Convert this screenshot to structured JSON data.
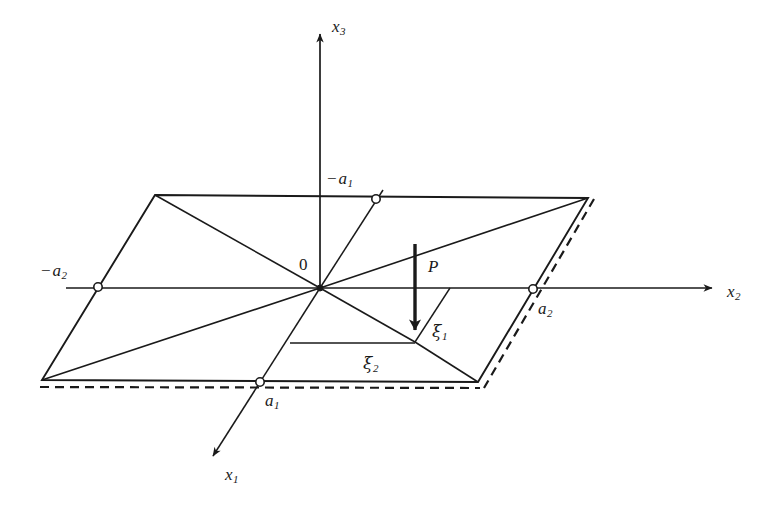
{
  "figure": {
    "background_color": "#ffffff",
    "stroke_color": "#1a1a1a"
  },
  "axes": [
    {
      "name": "x1-axis",
      "label_base": "x",
      "label_sub": "1",
      "direction": "down-left",
      "label_x": 225,
      "label_y": 466
    },
    {
      "name": "x2-axis",
      "label_base": "x",
      "label_sub": "2",
      "direction": "right",
      "label_x": 727,
      "label_y": 283
    },
    {
      "name": "x3-axis",
      "label_base": "x",
      "label_sub": "3",
      "direction": "up",
      "label_x": 332,
      "label_y": 18
    }
  ],
  "markers": [
    {
      "name": "marker-neg-a1",
      "minus": "−",
      "label_base": "a",
      "label_sub": "1",
      "cx": 376,
      "cy": 199,
      "label_x": 327,
      "label_y": 170
    },
    {
      "name": "marker-neg-a2",
      "minus": "−",
      "label_base": "a",
      "label_sub": "2",
      "cx": 98,
      "cy": 287,
      "label_x": 41,
      "label_y": 262
    },
    {
      "name": "marker-a1",
      "minus": "",
      "label_base": "a",
      "label_sub": "1",
      "cx": 260,
      "cy": 382,
      "label_x": 263,
      "label_y": 392
    },
    {
      "name": "marker-a2",
      "minus": "",
      "label_base": "a",
      "label_sub": "2",
      "cx": 533,
      "cy": 289,
      "label_x": 536,
      "label_y": 300
    }
  ],
  "annotations": {
    "origin": {
      "label": "0",
      "x": 299,
      "y": 256
    },
    "load": {
      "label": "P",
      "x": 428,
      "y": 258
    },
    "xi1": {
      "label_base": "ξ",
      "label_sub": "1",
      "x": 432,
      "y": 323
    },
    "xi2": {
      "label_base": "ξ",
      "label_sub": "2",
      "x": 363,
      "y": 355
    }
  },
  "geometry": {
    "origin": {
      "x": 320,
      "y": 288
    },
    "plate_corners": {
      "top_left": {
        "x": 155,
        "y": 195
      },
      "top_right": {
        "x": 588,
        "y": 198
      },
      "bottom_right": {
        "x": 478,
        "y": 382
      },
      "bottom_left": {
        "x": 42,
        "y": 380
      }
    },
    "load_point": {
      "x": 415,
      "y": 342
    },
    "arrow_top": {
      "x": 415,
      "y": 244
    }
  }
}
